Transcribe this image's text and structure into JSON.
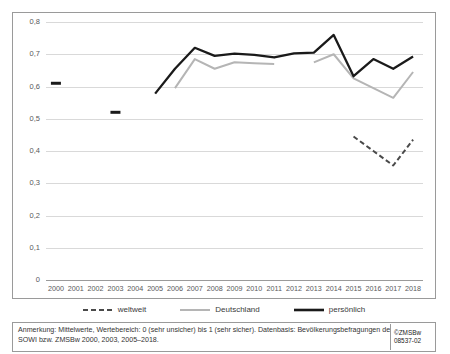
{
  "chart_data": {
    "type": "line",
    "title": "",
    "xlabel": "",
    "ylabel": "",
    "ylim": [
      0,
      0.8
    ],
    "ytick_step": 0.1,
    "grid": true,
    "legend_position": "bottom",
    "categories": [
      "2000",
      "2001",
      "2002",
      "2003",
      "2004",
      "2005",
      "2006",
      "2007",
      "2008",
      "2009",
      "2010",
      "2011",
      "2012",
      "2013",
      "2014",
      "2015",
      "2016",
      "2017",
      "2018"
    ],
    "ytick_labels": [
      "0",
      "0,1",
      "0,2",
      "0,3",
      "0,4",
      "0,5",
      "0,6",
      "0,7",
      "0,8"
    ],
    "ytick_values": [
      0,
      0.1,
      0.2,
      0.3,
      0.4,
      0.5,
      0.6,
      0.7,
      0.8
    ],
    "series": [
      {
        "name": "weltweit",
        "style": "dashed",
        "color": "#4a4a4a",
        "values": [
          null,
          null,
          null,
          null,
          null,
          null,
          null,
          null,
          null,
          null,
          null,
          null,
          null,
          null,
          null,
          0.445,
          0.4,
          0.355,
          0.435
        ]
      },
      {
        "name": "Deutschland",
        "style": "solid",
        "color": "#b5b5b5",
        "values": [
          null,
          null,
          null,
          null,
          null,
          null,
          0.595,
          0.685,
          0.655,
          0.675,
          0.672,
          0.67,
          null,
          0.675,
          0.7,
          0.625,
          0.595,
          0.565,
          0.645
        ]
      },
      {
        "name": "persönlich",
        "style": "solid",
        "color": "#1a1a1a",
        "values": [
          0.61,
          null,
          null,
          0.52,
          null,
          0.578,
          0.655,
          0.72,
          0.695,
          0.702,
          0.698,
          0.69,
          0.703,
          0.705,
          0.76,
          0.632,
          0.685,
          0.655,
          0.693
        ]
      }
    ]
  },
  "legend": {
    "items": [
      {
        "label": "weltweit",
        "style": "dashed",
        "color": "#4a4a4a"
      },
      {
        "label": "Deutschland",
        "style": "solid",
        "color": "#b5b5b5"
      },
      {
        "label": "persönlich",
        "style": "solid",
        "color": "#1a1a1a"
      }
    ]
  },
  "footnote": {
    "text": "Anmerkung: Mittelwerte, Wertebereich: 0 (sehr unsicher) bis 1 (sehr sicher). Datenbasis: Bevölkerungsbefragungen des SOWI bzw. ZMSBw 2000, 2003, 2005–2018."
  },
  "source": {
    "copyright": "©ZMSBw",
    "code": "08537-02"
  }
}
